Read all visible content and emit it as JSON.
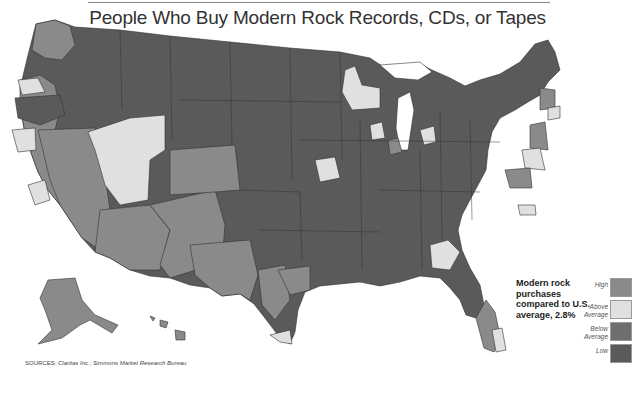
{
  "map": {
    "title": "People Who Buy Modern Rock Records, CDs, or Tapes",
    "subject": "United States media markets shaded by modern rock purchase index"
  },
  "legend": {
    "title": "Modern rock purchases compared to U.S. average, 2.8%",
    "items": [
      {
        "label": "High",
        "color": "#8a8a8a"
      },
      {
        "label": "Above Average",
        "color": "#e0e0e0"
      },
      {
        "label": "Below Average",
        "color": "#6e6e6e"
      },
      {
        "label": "Low",
        "color": "#5a5a5a"
      }
    ]
  },
  "source": {
    "prefix": "SOURCES:",
    "text": "Claritas Inc.; Simmons Market Research Bureau"
  },
  "colors": {
    "high": "#8a8a8a",
    "above_average": "#e0e0e0",
    "below_average": "#6e6e6e",
    "low": "#5a5a5a",
    "border": "#333333"
  }
}
